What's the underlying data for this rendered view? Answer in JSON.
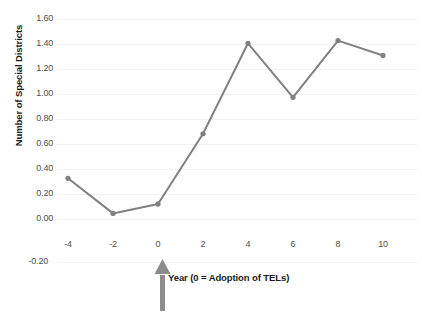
{
  "chart_data": {
    "type": "line",
    "title": "",
    "subtitle": "",
    "xlabel": "Year (0 = Adoption of TELs)",
    "ylabel": "Number of Special Districts",
    "x": [
      -4,
      -2,
      0,
      2,
      4,
      6,
      8,
      10
    ],
    "values": [
      0.42,
      0.16,
      0.23,
      0.75,
      1.42,
      1.02,
      1.44,
      1.33
    ],
    "series": [
      {
        "name": "Number of Special Districts",
        "values": [
          0.42,
          0.16,
          0.23,
          0.75,
          1.42,
          1.02,
          1.44,
          1.33
        ]
      }
    ],
    "x_tick_labels": [
      "-4",
      "-2",
      "0",
      "2",
      "4",
      "6",
      "8",
      "10"
    ],
    "y_tick_labels": [
      "1.60",
      "1.40",
      "1.20",
      "1.00",
      "0.80",
      "0.60",
      "0.40",
      "0.20",
      "0.00",
      "-0.20"
    ],
    "y_tick_values": [
      1.6,
      1.4,
      1.2,
      1.0,
      0.8,
      0.6,
      0.4,
      0.2,
      0.0,
      -0.2
    ],
    "xlim": [
      -5,
      11
    ],
    "ylim": [
      -0.2,
      1.6
    ],
    "grid": true,
    "legend": "none",
    "annotations": [
      {
        "name": "adoption-year-arrow",
        "shape": "up-arrow",
        "points_to_x": 0,
        "color": "#8c8c8c"
      }
    ],
    "colors": {
      "line": "#808080",
      "marker": "#808080",
      "gridline": "#f2f2f2",
      "tick_label": "#4d4d4d",
      "axis_title": "#1a1a1a",
      "background": "#ffffff"
    }
  }
}
